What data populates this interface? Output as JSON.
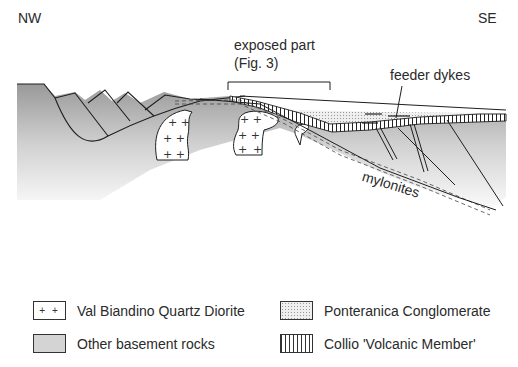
{
  "orientation": {
    "left": "NW",
    "right": "SE"
  },
  "annotations": {
    "exposed_part_line1": "exposed part",
    "exposed_part_line2": "(Fig. 3)",
    "feeder_dykes": "feeder dykes",
    "mylonites": "mylonites"
  },
  "legend": [
    {
      "swatch": "plus",
      "symbol": "+ +",
      "label": "Val Biandino Quartz Diorite"
    },
    {
      "swatch": "dots",
      "label": "Ponteranica Conglomerate"
    },
    {
      "swatch": "grey",
      "label": "Other basement rocks"
    },
    {
      "swatch": "vlines",
      "label": "Collio 'Volcanic Member'"
    }
  ],
  "colors": {
    "basement_top": "#8f8f8f",
    "basement_fade": "#ffffff",
    "line": "#1e1e1e",
    "text": "#2a2a2a"
  }
}
